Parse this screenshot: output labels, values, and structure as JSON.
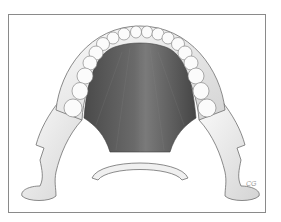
{
  "figure": {
    "signature": "CG",
    "colors": {
      "frame": "#8a8a8a",
      "bone": "#f2f2f2",
      "bone_shade": "#c8c8c8",
      "muscle": "#5a5a5a",
      "muscle_dark": "#3e3e3e",
      "outline": "#6f6f6f"
    }
  }
}
